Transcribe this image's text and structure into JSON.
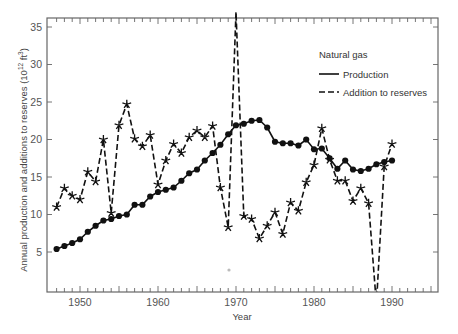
{
  "chart_data": {
    "type": "line",
    "title": "",
    "xlabel": "Year",
    "ylabel": "Annual production and additions to reserves (10^12 ft^3)",
    "ylabel_parts": {
      "main": "Annual production and additions to reserves (10",
      "sup1": "12",
      "mid": " ft",
      "sup2": "3",
      "end": ")"
    },
    "xlim": [
      1946,
      1996
    ],
    "ylim": [
      0,
      36
    ],
    "x_ticks": [
      1950,
      1960,
      1970,
      1980,
      1990
    ],
    "x_tick_labels": [
      "1950",
      "1960",
      "1970",
      "1980",
      "1990"
    ],
    "y_ticks": [
      5,
      10,
      15,
      20,
      25,
      30,
      35
    ],
    "y_tick_labels": [
      "5",
      "10",
      "15",
      "20",
      "25",
      "30",
      "35"
    ],
    "grid": false,
    "legend": {
      "title": "Natural gas",
      "position": "upper right",
      "entries": [
        "Production",
        "Addition to reserves"
      ]
    },
    "series": [
      {
        "name": "Production",
        "style": "solid",
        "marker": "circle",
        "x": [
          1947,
          1948,
          1949,
          1950,
          1951,
          1952,
          1953,
          1954,
          1955,
          1956,
          1957,
          1958,
          1959,
          1960,
          1961,
          1962,
          1963,
          1964,
          1965,
          1966,
          1967,
          1968,
          1969,
          1970,
          1971,
          1972,
          1973,
          1974,
          1975,
          1976,
          1977,
          1978,
          1979,
          1980,
          1981,
          1982,
          1983,
          1984,
          1985,
          1986,
          1987,
          1988,
          1989,
          1990
        ],
        "values": [
          5.4,
          5.8,
          6.2,
          6.7,
          7.7,
          8.5,
          9.2,
          9.4,
          9.8,
          10.0,
          11.3,
          11.3,
          12.4,
          13.0,
          13.3,
          13.6,
          14.5,
          15.5,
          16.0,
          17.2,
          18.2,
          19.3,
          20.7,
          21.9,
          22.1,
          22.5,
          22.6,
          21.6,
          19.7,
          19.5,
          19.5,
          19.2,
          20.0,
          18.7,
          18.8,
          17.5,
          16.1,
          17.2,
          16.0,
          15.8,
          16.1,
          16.7,
          17.0,
          17.2
        ]
      },
      {
        "name": "Addition to reserves",
        "style": "dashed",
        "marker": "star",
        "x": [
          1947,
          1948,
          1949,
          1950,
          1951,
          1952,
          1953,
          1954,
          1955,
          1956,
          1957,
          1958,
          1959,
          1960,
          1961,
          1962,
          1963,
          1964,
          1965,
          1966,
          1967,
          1968,
          1969,
          1970,
          1971,
          1972,
          1973,
          1974,
          1975,
          1976,
          1977,
          1978,
          1979,
          1980,
          1981,
          1982,
          1983,
          1984,
          1985,
          1986,
          1987,
          1988,
          1989,
          1990
        ],
        "values": [
          11.0,
          13.5,
          12.5,
          12.0,
          15.7,
          14.4,
          20.0,
          10.2,
          21.9,
          24.7,
          20.1,
          19.1,
          20.6,
          14.0,
          17.2,
          19.4,
          18.2,
          20.3,
          21.2,
          20.3,
          21.8,
          13.6,
          8.3,
          37.0,
          9.8,
          9.4,
          6.8,
          8.5,
          10.3,
          7.4,
          11.6,
          10.5,
          14.3,
          16.6,
          21.5,
          17.3,
          14.5,
          14.5,
          11.8,
          13.5,
          11.5,
          -2.0,
          16.4,
          19.4
        ]
      }
    ],
    "annotations": []
  }
}
